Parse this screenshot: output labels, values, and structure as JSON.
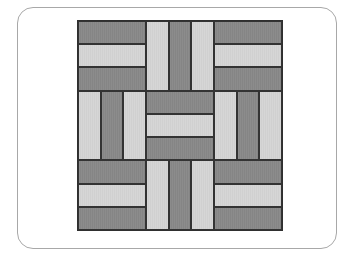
{
  "figure": {
    "grid": {
      "rows": 3,
      "cols": 3
    },
    "colors": {
      "dark": "#8a8a8a",
      "light": "#d4d4d4",
      "outline": "#333333",
      "card_border": "#a8a8a8"
    },
    "blocks": [
      {
        "row": 1,
        "col": 1,
        "orientation": "horizontal",
        "stripes": [
          "dark",
          "light",
          "dark"
        ]
      },
      {
        "row": 1,
        "col": 2,
        "orientation": "vertical",
        "stripes": [
          "light",
          "dark",
          "light"
        ]
      },
      {
        "row": 1,
        "col": 3,
        "orientation": "horizontal",
        "stripes": [
          "dark",
          "light",
          "dark"
        ]
      },
      {
        "row": 2,
        "col": 1,
        "orientation": "vertical",
        "stripes": [
          "light",
          "dark",
          "light"
        ]
      },
      {
        "row": 2,
        "col": 2,
        "orientation": "horizontal",
        "stripes": [
          "dark",
          "light",
          "dark"
        ]
      },
      {
        "row": 2,
        "col": 3,
        "orientation": "vertical",
        "stripes": [
          "light",
          "dark",
          "light"
        ]
      },
      {
        "row": 3,
        "col": 1,
        "orientation": "horizontal",
        "stripes": [
          "dark",
          "light",
          "dark"
        ]
      },
      {
        "row": 3,
        "col": 2,
        "orientation": "vertical",
        "stripes": [
          "light",
          "dark",
          "light"
        ]
      },
      {
        "row": 3,
        "col": 3,
        "orientation": "horizontal",
        "stripes": [
          "dark",
          "light",
          "dark"
        ]
      }
    ]
  }
}
